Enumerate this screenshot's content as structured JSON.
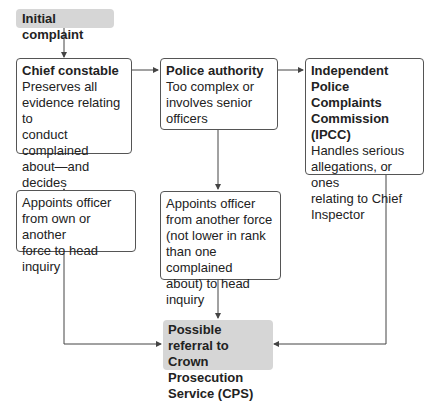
{
  "diagram": {
    "start": {
      "label": "Initial complaint"
    },
    "chief": {
      "title": "Chief constable",
      "body": "Preserves all\nevidence relating to\nconduct complained\nabout—and decides\nwhere to refer it"
    },
    "authority": {
      "title": "Police authority",
      "body": "Too complex or\ninvolves senior\nofficers"
    },
    "ipcc": {
      "title": "Independent Police\nComplaints\nCommission (IPCC)",
      "body": "Handles serious\nallegations, or ones\nrelating to Chief\nInspector"
    },
    "appoint_own": {
      "body": "Appoints officer\nfrom own or another\nforce to head inquiry"
    },
    "appoint_other": {
      "body": "Appoints officer\nfrom another force\n(not lower in rank\nthan one complained\nabout) to head\ninquiry"
    },
    "cps": {
      "label": "Possible referral to\nCrown Prosecution\nService (CPS)"
    },
    "colors": {
      "node_fill": "#d6d6d6",
      "border": "#555555",
      "line": "#444444"
    }
  }
}
